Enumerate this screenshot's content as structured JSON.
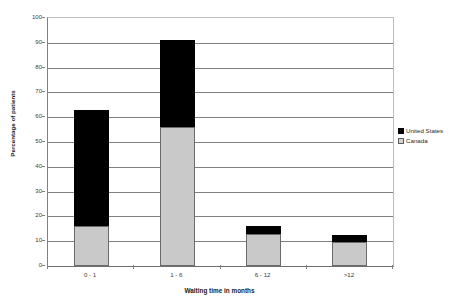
{
  "chart_data": {
    "type": "bar",
    "subtype": "stacked-bar",
    "title": "",
    "subtitle": "",
    "xlabel": "Waiting time in months",
    "ylabel": "Percentage of patients",
    "categories": [
      "0 - 1",
      "1 - 6",
      "6 - 12",
      ">12"
    ],
    "series": [
      {
        "name": "Canada",
        "color": "#c9c9c9",
        "values": [
          16,
          56,
          13,
          9.7
        ]
      },
      {
        "name": "United States",
        "color": "#000000",
        "values": [
          47,
          35,
          3,
          2.8
        ]
      }
    ],
    "cumulative_totals": [
      63,
      91,
      16,
      12.5
    ],
    "ylim": [
      0,
      100
    ],
    "ytick_step": 10,
    "yticks": [
      100,
      90,
      80,
      70,
      60,
      50,
      40,
      30,
      20,
      10,
      0
    ],
    "grid": true,
    "grid_axis": "y",
    "legend_position": "right"
  },
  "axes": {
    "y_title": "Percentage of patients",
    "x_title": "Waiting time in months",
    "y_tick_labels": [
      "100",
      "90",
      "80",
      "70",
      "60",
      "50",
      "40",
      "30",
      "20",
      "10",
      "0"
    ],
    "x_tick_labels": [
      "0 - 1",
      "1 - 6",
      "6 - 12",
      ">12"
    ]
  },
  "legend": {
    "items": [
      {
        "label": "United States",
        "swatch": "black-square"
      },
      {
        "label": "Canada",
        "swatch": "gray-square"
      }
    ]
  },
  "title": {
    "text": ""
  }
}
